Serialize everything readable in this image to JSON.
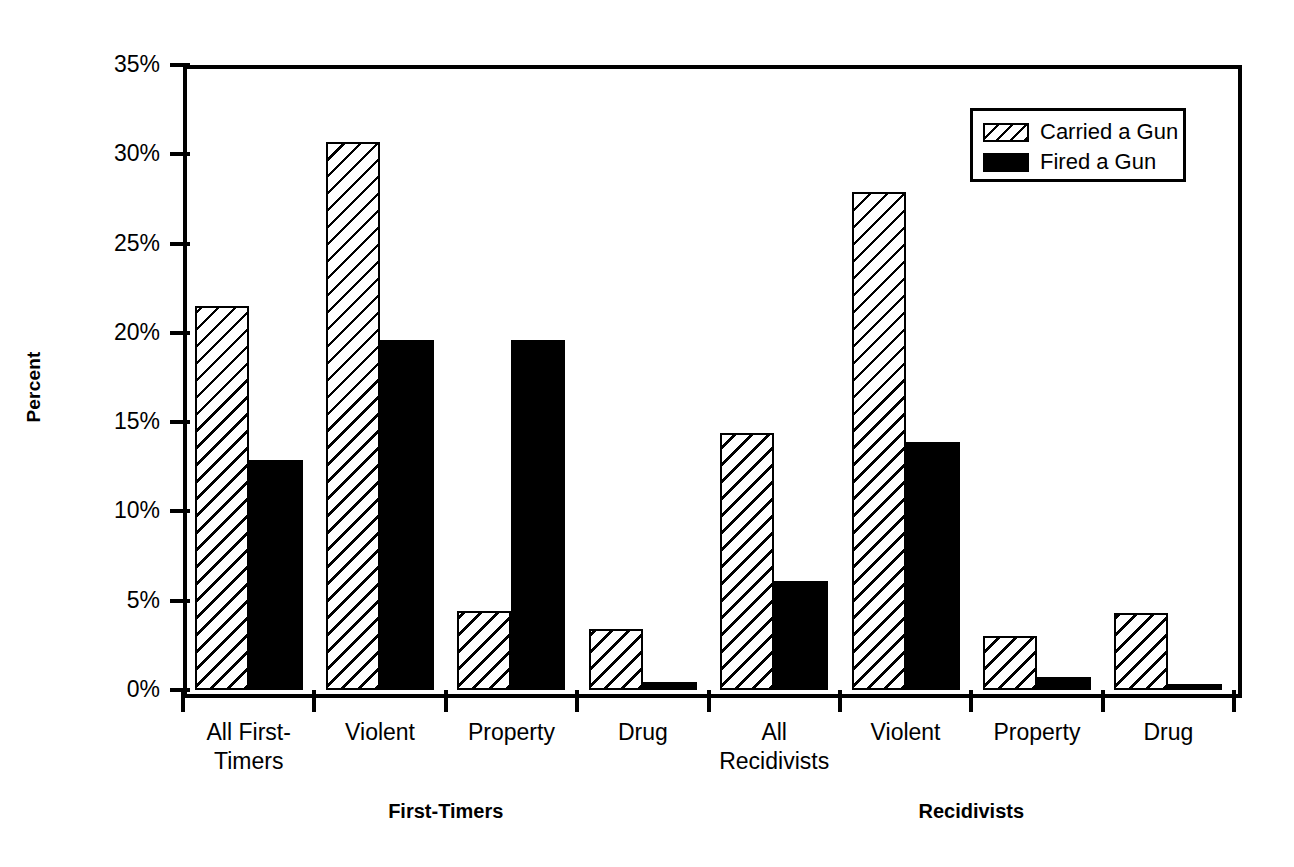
{
  "chart_data": {
    "type": "bar",
    "title": "",
    "xlabel": "",
    "ylabel": "Percent",
    "ylim": [
      0,
      35
    ],
    "grid": false,
    "legend_position": "top-right",
    "y_ticks": [
      "0%",
      "5%",
      "10%",
      "15%",
      "20%",
      "25%",
      "30%",
      "35%"
    ],
    "y_tick_values": [
      0,
      5,
      10,
      15,
      20,
      25,
      30,
      35
    ],
    "categories": [
      "All First-Timers",
      "Violent",
      "Property",
      "Drug",
      "All Recidivists",
      "Violent",
      "Property",
      "Drug"
    ],
    "category_lines": [
      [
        "All First-",
        "Timers"
      ],
      [
        "Violent"
      ],
      [
        "Property"
      ],
      [
        "Drug"
      ],
      [
        "All",
        "Recidivists"
      ],
      [
        "Violent"
      ],
      [
        "Property"
      ],
      [
        "Drug"
      ]
    ],
    "groups": [
      {
        "label": "First-Timers",
        "categories": [
          0,
          1,
          2,
          3
        ]
      },
      {
        "label": "Recidivists",
        "categories": [
          4,
          5,
          6,
          7
        ]
      }
    ],
    "series": [
      {
        "name": "Carried a Gun",
        "pattern": "hatched",
        "color": "#000000",
        "values": [
          21.5,
          30.7,
          4.4,
          3.4,
          14.4,
          27.9,
          3.0,
          4.3
        ]
      },
      {
        "name": "Fired a Gun",
        "pattern": "solid",
        "color": "#000000",
        "values": [
          12.9,
          19.6,
          19.6,
          0.45,
          6.1,
          13.9,
          0.75,
          0.35
        ]
      }
    ]
  },
  "legend": {
    "items": [
      {
        "label": "Carried a Gun",
        "pattern": "hatched"
      },
      {
        "label": "Fired a Gun",
        "pattern": "solid"
      }
    ]
  }
}
